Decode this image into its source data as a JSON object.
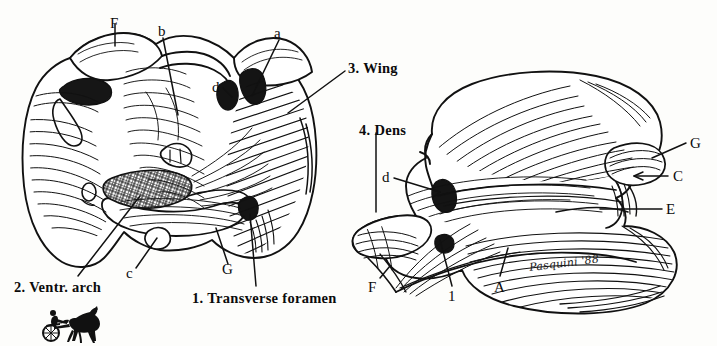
{
  "figure": {
    "artist_signature": "Pasquini '88",
    "ink_color": "#111111",
    "paper_color": "#fdfdfb"
  },
  "left_view": {
    "name": "cranial-view",
    "labels": [
      {
        "id": "F",
        "text": "F",
        "x": 110,
        "y": 16,
        "kind": "letter"
      },
      {
        "id": "b",
        "text": "b",
        "x": 158,
        "y": 30,
        "kind": "letter"
      },
      {
        "id": "a",
        "text": "a",
        "x": 274,
        "y": 30,
        "kind": "letter"
      },
      {
        "id": "d",
        "text": "d",
        "x": 215,
        "y": 82,
        "kind": "letter"
      },
      {
        "id": "c",
        "text": "c",
        "x": 127,
        "y": 275,
        "kind": "letter"
      },
      {
        "id": "G",
        "text": "G",
        "x": 224,
        "y": 272,
        "kind": "letter"
      },
      {
        "id": "wing",
        "text": "3. Wing",
        "x": 348,
        "y": 60,
        "kind": "number"
      },
      {
        "id": "ventr-arch",
        "text": "2. Ventr. arch",
        "x": 14,
        "y": 279,
        "kind": "number"
      },
      {
        "id": "transverse-foramen",
        "text": "1. Transverse foramen",
        "x": 192,
        "y": 289,
        "kind": "number"
      }
    ]
  },
  "right_view": {
    "name": "lateral-view",
    "labels": [
      {
        "id": "dens",
        "text": "4. Dens",
        "x": 359,
        "y": 122,
        "kind": "number"
      },
      {
        "id": "d",
        "text": "d",
        "x": 384,
        "y": 173,
        "kind": "letter"
      },
      {
        "id": "G",
        "text": "G",
        "x": 690,
        "y": 138,
        "kind": "letter"
      },
      {
        "id": "C",
        "text": "C",
        "x": 673,
        "y": 170,
        "kind": "letter"
      },
      {
        "id": "E",
        "text": "E",
        "x": 666,
        "y": 203,
        "kind": "letter"
      },
      {
        "id": "F",
        "text": "F",
        "x": 369,
        "y": 280,
        "kind": "letter"
      },
      {
        "id": "1",
        "text": "1",
        "x": 448,
        "y": 290,
        "kind": "letter"
      },
      {
        "id": "A",
        "text": "A",
        "x": 496,
        "y": 280,
        "kind": "letter"
      }
    ]
  },
  "legend_keys": {
    "1": "Transverse foramen",
    "2": "Ventr. arch",
    "3": "Wing",
    "4": "Dens",
    "letters": [
      "A",
      "C",
      "E",
      "F",
      "G",
      "a",
      "b",
      "c",
      "d"
    ]
  },
  "icon": {
    "name": "harness-racing-horse-icon",
    "description": "black silhouette of trotting horse pulling a sulky with driver",
    "x": 40,
    "y": 306,
    "width": 66,
    "height": 36
  }
}
